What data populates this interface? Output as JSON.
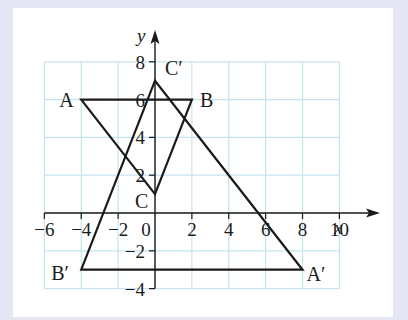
{
  "diagram": {
    "type": "coordinate-geometry-transformation",
    "axes": {
      "x_label": "x",
      "y_label": "y",
      "x_range": [
        -6,
        10
      ],
      "y_range": [
        -4,
        8
      ],
      "x_ticks": [
        -6,
        -4,
        -2,
        0,
        2,
        4,
        6,
        8,
        10
      ],
      "x_tick_labels": [
        "−6",
        "−4",
        "−2",
        "0",
        "2",
        "4",
        "6",
        "8",
        "10"
      ],
      "y_ticks": [
        8,
        6,
        4,
        2,
        -2,
        -4
      ],
      "y_tick_labels": [
        "8",
        "6",
        "4",
        "2",
        "−2",
        "−4"
      ],
      "grid": true,
      "grid_step": 2,
      "grid_color": "#c6e4ef"
    },
    "triangles": [
      {
        "name": "ABC",
        "vertices": [
          {
            "label": "A",
            "x": -4,
            "y": 6
          },
          {
            "label": "B",
            "x": 2,
            "y": 6
          },
          {
            "label": "C",
            "x": 0,
            "y": 1
          }
        ]
      },
      {
        "name": "A'B'C'",
        "vertices": [
          {
            "label": "A′",
            "x": 8,
            "y": -3
          },
          {
            "label": "B′",
            "x": -4,
            "y": -3
          },
          {
            "label": "C′",
            "x": 0,
            "y": 7
          }
        ]
      }
    ],
    "colors": {
      "background": "#e4e7f3",
      "panel": "#ffffff",
      "lines": "#1a1a1a"
    }
  }
}
